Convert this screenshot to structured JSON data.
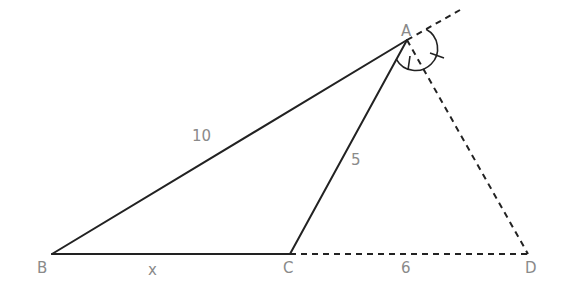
{
  "figure": {
    "points": {
      "A": {
        "label": "A",
        "x": 407,
        "y": 40
      },
      "B": {
        "label": "B",
        "x": 52,
        "y": 254
      },
      "C": {
        "label": "C",
        "x": 290,
        "y": 254
      },
      "D": {
        "label": "D",
        "x": 528,
        "y": 254
      }
    },
    "segments": [
      {
        "from": "A",
        "to": "B",
        "style": "solid",
        "label": "10"
      },
      {
        "from": "A",
        "to": "C",
        "style": "solid",
        "label": "5"
      },
      {
        "from": "B",
        "to": "C",
        "style": "solid",
        "label": "x"
      },
      {
        "from": "C",
        "to": "D",
        "style": "dashed",
        "label": "6"
      },
      {
        "from": "A",
        "to": "D",
        "style": "dashed",
        "label": ""
      },
      {
        "from": "A",
        "to": "extension",
        "style": "dashed",
        "label": ""
      }
    ],
    "labels": {
      "A": "A",
      "B": "B",
      "C": "C",
      "D": "D",
      "AB": "10",
      "AC": "5",
      "BC": "x",
      "CD": "6"
    },
    "angle_marks": {
      "vertex": "A",
      "type": "equal-angle arcs with single tick marks",
      "count": 2
    },
    "colors": {
      "line": "#222222",
      "label": "#8a8a8a"
    }
  }
}
